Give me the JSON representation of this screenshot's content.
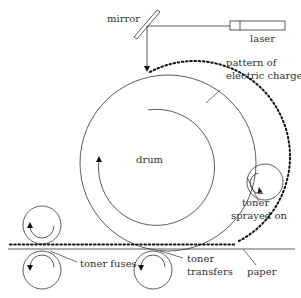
{
  "diagram": {
    "labels": {
      "mirror": "mirror",
      "laser": "laser",
      "pattern_line1": "pattern of",
      "pattern_line2": "electric charge",
      "drum": "drum",
      "toner_sprayed_line1": "toner",
      "toner_sprayed_line2": "sprayed on",
      "toner_fuses": "toner fuses",
      "toner_transfers_line1": "toner",
      "toner_transfers_line2": "transfers",
      "paper": "paper"
    },
    "colors": {
      "stroke": "#333333",
      "background": "#ffffff"
    }
  }
}
